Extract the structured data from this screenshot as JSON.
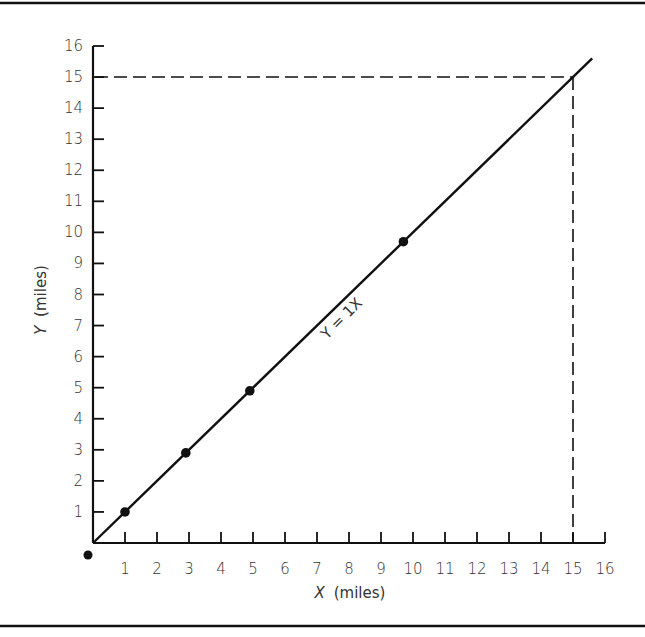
{
  "chart_data": {
    "type": "line",
    "title": "",
    "xlabel": "X (miles)",
    "xlabel_var": "X",
    "xlabel_unit": "(miles)",
    "ylabel": "Y (miles)",
    "ylabel_var": "Y",
    "ylabel_unit": "(miles)",
    "xlim": [
      0,
      16
    ],
    "ylim": [
      0,
      16
    ],
    "xticks": [
      1,
      2,
      3,
      4,
      5,
      6,
      7,
      8,
      9,
      10,
      11,
      12,
      13,
      14,
      15,
      16
    ],
    "yticks": [
      1,
      2,
      3,
      4,
      5,
      6,
      7,
      8,
      9,
      10,
      11,
      12,
      13,
      14,
      15,
      16
    ],
    "grid": false,
    "legend": null,
    "series": [
      {
        "name": "Y = 1X",
        "equation": "Y = 1X",
        "slope": 1,
        "line_x_range": [
          0,
          15.6
        ],
        "points": [
          {
            "x": 0,
            "y": 0
          },
          {
            "x": 1,
            "y": 1
          },
          {
            "x": 2.9,
            "y": 2.9
          },
          {
            "x": 4.9,
            "y": 4.9
          },
          {
            "x": 9.7,
            "y": 9.7
          }
        ]
      }
    ],
    "annotations": [
      {
        "type": "dashed-reference",
        "x": 15,
        "y": 15,
        "description": "Dashed lines from (15, 15) to both axes"
      },
      {
        "type": "line-label",
        "text": "Y = 1X",
        "rotation_deg": -45
      }
    ]
  }
}
